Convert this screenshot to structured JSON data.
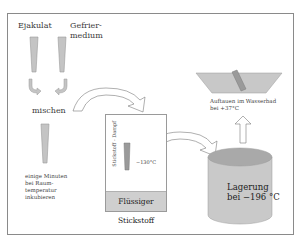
{
  "labels": {
    "ejakulat": "Ejakulat",
    "gefrier_line1": "Gefrier-",
    "gefrier_line2": "medium",
    "mischen": "mischen",
    "incubate_line1": "einige Minuten",
    "incubate_line2": "bei Raum-",
    "incubate_line3": "temperatur",
    "incubate_line4": "inkubieren",
    "vapor": "Stickstoff - Dampf",
    "vapor_temp": "−130°C",
    "liquid_nitrogen": "Flüssiger Stickstoff",
    "storage_line1": "Lagerung",
    "storage_line2": "bei −196 °C",
    "thaw_line1": "Auftauen im Wasserbad",
    "thaw_line2": "bei +37°C"
  },
  "colors": {
    "straw_fill": "#c4c4c4",
    "straw_stroke": "#9a9a9a",
    "liquid_fill": "#cfcfcf",
    "tank_fill": "#c9c9c9",
    "tank_top": "#a9a9a9",
    "bath_fill": "#c8c8c8",
    "frame": "#8a8a8a"
  }
}
